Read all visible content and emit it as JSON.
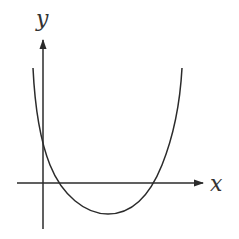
{
  "diagram": {
    "type": "function-graph",
    "axes": {
      "x_label": "x",
      "y_label": "y"
    },
    "colors": {
      "stroke": "#2b2b2b",
      "background": "#ffffff"
    }
  }
}
